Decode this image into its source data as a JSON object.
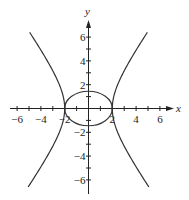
{
  "chart_data": {
    "type": "line",
    "title": "",
    "xlabel": "x",
    "ylabel": "y",
    "xlim": [
      -6.5,
      7
    ],
    "ylim": [
      -7,
      7.5
    ],
    "grid": false,
    "legend": null,
    "x_ticks": [
      -6,
      -5,
      -4,
      -3,
      -2,
      -1,
      1,
      2,
      3,
      4,
      5,
      6
    ],
    "x_tick_labels": [
      {
        "value": -6,
        "label": "-6"
      },
      {
        "value": -4,
        "label": "-4"
      },
      {
        "value": -2,
        "label": "-2"
      },
      {
        "value": 2,
        "label": "2"
      },
      {
        "value": 4,
        "label": "4"
      },
      {
        "value": 6,
        "label": "6"
      }
    ],
    "y_ticks": [
      -6,
      -5,
      -4,
      -3,
      -2,
      -1,
      1,
      2,
      3,
      4,
      5,
      6
    ],
    "y_tick_labels": [
      {
        "value": 6,
        "label": "6"
      },
      {
        "value": 4,
        "label": "4"
      },
      {
        "value": 2,
        "label": "2"
      },
      {
        "value": -2,
        "label": "-2"
      },
      {
        "value": -4,
        "label": "-4"
      },
      {
        "value": -6,
        "label": "-6"
      }
    ],
    "series": [
      {
        "name": "ellipse",
        "kind": "ellipse",
        "equation": "x^2/4 + y^2/2 = 1",
        "a": 2,
        "b": 1.45,
        "color": "#333333"
      },
      {
        "name": "hyperbola",
        "kind": "hyperbola",
        "equation": "x^2/4 - y^2/8 = 1",
        "a": 2,
        "b": 2.83,
        "y_range": [
          -6.6,
          6.4
        ],
        "color": "#333333"
      }
    ]
  }
}
